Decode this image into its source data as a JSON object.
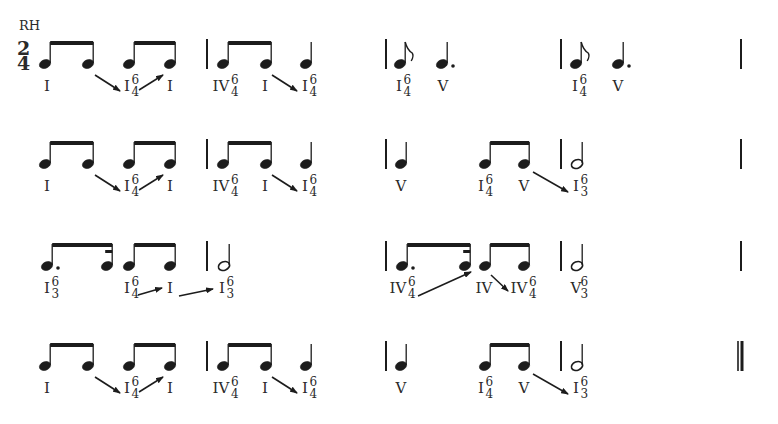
{
  "header": {
    "hand_label": "RH",
    "time_signature": {
      "top": "2",
      "bottom": "4"
    }
  },
  "colors": {
    "ink": "#1c1c1c",
    "text": "#2a2a2a",
    "background": "#ffffff"
  },
  "rows": [
    {
      "y": 64,
      "barlines": [
        {
          "x": 207
        },
        {
          "x": 386
        },
        {
          "x": 561
        },
        {
          "x": 741
        }
      ],
      "notes": [
        {
          "x": 45,
          "type": "eighth"
        },
        {
          "x": 88,
          "type": "eighth"
        },
        {
          "x": 129,
          "type": "eighth"
        },
        {
          "x": 170,
          "type": "eighth"
        },
        {
          "x": 223,
          "type": "eighth"
        },
        {
          "x": 266,
          "type": "eighth"
        },
        {
          "x": 306,
          "type": "quarter"
        },
        {
          "x": 400,
          "type": "eighth-flag"
        },
        {
          "x": 442,
          "type": "dotted-quarter"
        },
        {
          "x": 576,
          "type": "eighth-flag"
        },
        {
          "x": 618,
          "type": "dotted-quarter"
        }
      ],
      "beams": [
        {
          "x1": 45,
          "x2": 88
        },
        {
          "x1": 129,
          "x2": 170
        },
        {
          "x1": 223,
          "x2": 266
        }
      ],
      "labels": [
        {
          "x": 47,
          "numeral": "I"
        },
        {
          "x": 127,
          "numeral": "I",
          "sup": "6",
          "sub": "4"
        },
        {
          "x": 170,
          "numeral": "I"
        },
        {
          "x": 221,
          "numeral": "IV",
          "sup": "6",
          "sub": "4"
        },
        {
          "x": 265,
          "numeral": "I"
        },
        {
          "x": 305,
          "numeral": "I",
          "sup": "6",
          "sub": "4"
        },
        {
          "x": 399,
          "numeral": "I",
          "sup": "6",
          "sub": "4"
        },
        {
          "x": 443,
          "numeral": "V"
        },
        {
          "x": 575,
          "numeral": "I",
          "sup": "6",
          "sub": "4"
        },
        {
          "x": 618,
          "numeral": "V"
        }
      ],
      "arrows": [
        {
          "x1": 95,
          "y1": 75,
          "x2": 120,
          "y2": 91
        },
        {
          "x1": 139,
          "y1": 90,
          "x2": 163,
          "y2": 75
        },
        {
          "x1": 272,
          "y1": 75,
          "x2": 297,
          "y2": 91
        }
      ]
    },
    {
      "y": 164,
      "barlines": [
        {
          "x": 207
        },
        {
          "x": 386
        },
        {
          "x": 561
        },
        {
          "x": 741
        }
      ],
      "notes": [
        {
          "x": 45,
          "type": "eighth"
        },
        {
          "x": 88,
          "type": "eighth"
        },
        {
          "x": 129,
          "type": "eighth"
        },
        {
          "x": 170,
          "type": "eighth"
        },
        {
          "x": 223,
          "type": "eighth"
        },
        {
          "x": 266,
          "type": "eighth"
        },
        {
          "x": 306,
          "type": "quarter"
        },
        {
          "x": 401,
          "type": "quarter"
        },
        {
          "x": 485,
          "type": "eighth"
        },
        {
          "x": 524,
          "type": "eighth"
        },
        {
          "x": 577,
          "type": "half"
        }
      ],
      "beams": [
        {
          "x1": 45,
          "x2": 88
        },
        {
          "x1": 129,
          "x2": 170
        },
        {
          "x1": 223,
          "x2": 266
        },
        {
          "x1": 485,
          "x2": 524
        }
      ],
      "labels": [
        {
          "x": 47,
          "numeral": "I"
        },
        {
          "x": 127,
          "numeral": "I",
          "sup": "6",
          "sub": "4"
        },
        {
          "x": 170,
          "numeral": "I"
        },
        {
          "x": 221,
          "numeral": "IV",
          "sup": "6",
          "sub": "4"
        },
        {
          "x": 265,
          "numeral": "I"
        },
        {
          "x": 305,
          "numeral": "I",
          "sup": "6",
          "sub": "4"
        },
        {
          "x": 401,
          "numeral": "V"
        },
        {
          "x": 481,
          "numeral": "I",
          "sup": "6",
          "sub": "4"
        },
        {
          "x": 524,
          "numeral": "V"
        },
        {
          "x": 576,
          "numeral": "I",
          "sup": "6",
          "sub": "3"
        }
      ],
      "arrows": [
        {
          "x1": 95,
          "y1": 175,
          "x2": 120,
          "y2": 191
        },
        {
          "x1": 139,
          "y1": 190,
          "x2": 163,
          "y2": 175
        },
        {
          "x1": 272,
          "y1": 175,
          "x2": 297,
          "y2": 191
        },
        {
          "x1": 533,
          "y1": 172,
          "x2": 568,
          "y2": 192
        }
      ]
    },
    {
      "y": 266,
      "barlines": [
        {
          "x": 207
        },
        {
          "x": 386
        },
        {
          "x": 561
        },
        {
          "x": 741
        }
      ],
      "notes": [
        {
          "x": 47,
          "type": "dotted-eighth"
        },
        {
          "x": 107,
          "type": "sixteenth"
        },
        {
          "x": 129,
          "type": "eighth"
        },
        {
          "x": 170,
          "type": "eighth"
        },
        {
          "x": 224,
          "type": "half"
        },
        {
          "x": 402,
          "type": "dotted-eighth"
        },
        {
          "x": 465,
          "type": "sixteenth"
        },
        {
          "x": 485,
          "type": "eighth"
        },
        {
          "x": 524,
          "type": "eighth"
        },
        {
          "x": 577,
          "type": "half"
        }
      ],
      "beams": [
        {
          "x1": 47,
          "x2": 107,
          "partial": true
        },
        {
          "x1": 129,
          "x2": 170
        },
        {
          "x1": 402,
          "x2": 465,
          "partial": true
        },
        {
          "x1": 485,
          "x2": 524
        }
      ],
      "labels": [
        {
          "x": 47,
          "numeral": "I",
          "sup": "6",
          "sub": "3"
        },
        {
          "x": 127,
          "numeral": "I",
          "sup": "6",
          "sub": "4"
        },
        {
          "x": 170,
          "numeral": "I"
        },
        {
          "x": 222,
          "numeral": "I",
          "sup": "6",
          "sub": "3"
        },
        {
          "x": 398,
          "numeral": "IV",
          "sup": "6",
          "sub": "4"
        },
        {
          "x": 484,
          "numeral": "IV"
        },
        {
          "x": 519,
          "numeral": "IV",
          "sup": "6",
          "sub": "4"
        },
        {
          "x": 576,
          "numeral": "V",
          "sup": "6",
          "sub": "3"
        }
      ],
      "arrows": [
        {
          "x1": 138,
          "y1": 295,
          "x2": 162,
          "y2": 288
        },
        {
          "x1": 179,
          "y1": 296,
          "x2": 213,
          "y2": 289
        },
        {
          "x1": 418,
          "y1": 296,
          "x2": 471,
          "y2": 272
        },
        {
          "x1": 491,
          "y1": 275,
          "x2": 508,
          "y2": 291
        }
      ]
    },
    {
      "y": 366,
      "barlines": [
        {
          "x": 207
        },
        {
          "x": 386
        },
        {
          "x": 561
        },
        {
          "x": 741,
          "double": true
        }
      ],
      "notes": [
        {
          "x": 45,
          "type": "eighth"
        },
        {
          "x": 88,
          "type": "eighth"
        },
        {
          "x": 129,
          "type": "eighth"
        },
        {
          "x": 170,
          "type": "eighth"
        },
        {
          "x": 223,
          "type": "eighth"
        },
        {
          "x": 266,
          "type": "eighth"
        },
        {
          "x": 306,
          "type": "quarter"
        },
        {
          "x": 401,
          "type": "quarter"
        },
        {
          "x": 485,
          "type": "eighth"
        },
        {
          "x": 524,
          "type": "eighth"
        },
        {
          "x": 577,
          "type": "half"
        }
      ],
      "beams": [
        {
          "x1": 45,
          "x2": 88
        },
        {
          "x1": 129,
          "x2": 170
        },
        {
          "x1": 223,
          "x2": 266
        },
        {
          "x1": 485,
          "x2": 524
        }
      ],
      "labels": [
        {
          "x": 47,
          "numeral": "I"
        },
        {
          "x": 127,
          "numeral": "I",
          "sup": "6",
          "sub": "4"
        },
        {
          "x": 170,
          "numeral": "I"
        },
        {
          "x": 221,
          "numeral": "IV",
          "sup": "6",
          "sub": "4"
        },
        {
          "x": 265,
          "numeral": "I"
        },
        {
          "x": 305,
          "numeral": "I",
          "sup": "6",
          "sub": "4"
        },
        {
          "x": 401,
          "numeral": "V"
        },
        {
          "x": 481,
          "numeral": "I",
          "sup": "6",
          "sub": "4"
        },
        {
          "x": 524,
          "numeral": "V"
        },
        {
          "x": 576,
          "numeral": "I",
          "sup": "6",
          "sub": "3"
        }
      ],
      "arrows": [
        {
          "x1": 95,
          "y1": 377,
          "x2": 120,
          "y2": 393
        },
        {
          "x1": 139,
          "y1": 392,
          "x2": 163,
          "y2": 377
        },
        {
          "x1": 272,
          "y1": 377,
          "x2": 297,
          "y2": 393
        },
        {
          "x1": 533,
          "y1": 374,
          "x2": 568,
          "y2": 394
        }
      ]
    }
  ]
}
